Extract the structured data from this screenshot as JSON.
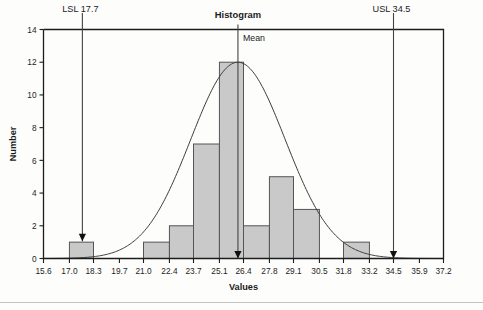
{
  "chart_data": {
    "type": "bar",
    "title": "Histogram",
    "xlabel": "Values",
    "ylabel": "Number",
    "xlim": [
      15.6,
      37.2
    ],
    "ylim": [
      0,
      14
    ],
    "grid": false,
    "legend": "none",
    "x_tick_labels": [
      "15.6",
      "17.0",
      "18.3",
      "19.7",
      "21.0",
      "22.4",
      "23.7",
      "25.1",
      "26.4",
      "27.8",
      "29.1",
      "30.5",
      "31.8",
      "33.2",
      "34.5",
      "35.9",
      "37.2"
    ],
    "x_tick_values": [
      15.6,
      17.0,
      18.3,
      19.7,
      21.0,
      22.4,
      23.7,
      25.1,
      26.4,
      27.8,
      29.1,
      30.5,
      31.8,
      33.2,
      34.5,
      35.9,
      37.2
    ],
    "y_tick_labels": [
      "0",
      "2",
      "4",
      "6",
      "8",
      "10",
      "12",
      "14"
    ],
    "y_tick_values": [
      0,
      2,
      4,
      6,
      8,
      10,
      12,
      14
    ],
    "bin_width": 1.35,
    "bins": [
      {
        "start": 15.6,
        "end": 17.0,
        "count": 0
      },
      {
        "start": 17.0,
        "end": 18.3,
        "count": 1
      },
      {
        "start": 18.3,
        "end": 19.7,
        "count": 0
      },
      {
        "start": 19.7,
        "end": 21.0,
        "count": 0
      },
      {
        "start": 21.0,
        "end": 22.4,
        "count": 1
      },
      {
        "start": 22.4,
        "end": 23.7,
        "count": 2
      },
      {
        "start": 23.7,
        "end": 25.1,
        "count": 7
      },
      {
        "start": 25.1,
        "end": 26.4,
        "count": 12
      },
      {
        "start": 26.4,
        "end": 27.8,
        "count": 2
      },
      {
        "start": 27.8,
        "end": 29.1,
        "count": 5
      },
      {
        "start": 29.1,
        "end": 30.5,
        "count": 3
      },
      {
        "start": 30.5,
        "end": 31.8,
        "count": 0
      },
      {
        "start": 31.8,
        "end": 33.2,
        "count": 1
      },
      {
        "start": 33.2,
        "end": 34.5,
        "count": 0
      },
      {
        "start": 34.5,
        "end": 35.9,
        "count": 0
      },
      {
        "start": 35.9,
        "end": 37.2,
        "count": 0
      }
    ],
    "bar_fill_color": "#c9c9c9",
    "bar_edge_color": "#555555",
    "curve": {
      "name": "normal-fit-curve",
      "mean": 26.1,
      "std_dev": 2.55,
      "peak_value": 12.0,
      "color": "#3c3c3c"
    },
    "annotations": [
      {
        "name": "lsl",
        "label": "LSL 17.7",
        "value": 17.7,
        "arrow": "down"
      },
      {
        "name": "mean",
        "label": "Mean",
        "value": 26.1,
        "arrow": "down"
      },
      {
        "name": "usl",
        "label": "USL 34.5",
        "value": 34.5,
        "arrow": "down"
      }
    ]
  }
}
